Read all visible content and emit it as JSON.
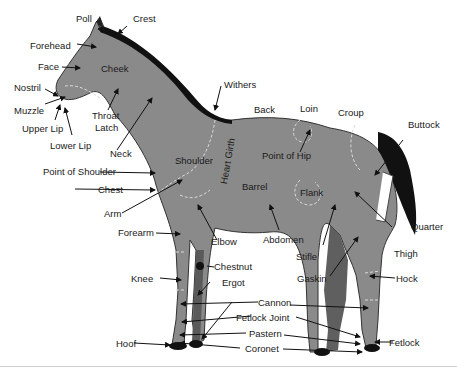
{
  "diagram": {
    "colors": {
      "body": "#8a8a8a",
      "mane_tail": "#111111",
      "shade_leg": "#5a5a5a",
      "seam": "#d8d8d8",
      "text": "#1a1a1a"
    },
    "labels": {
      "poll": "Poll",
      "crest": "Crest",
      "forehead": "Forehead",
      "face": "Face",
      "cheek": "Cheek",
      "nostril": "Nostril",
      "muzzle": "Muzzle",
      "upper_lip": "Upper Lip",
      "lower_lip": "Lower Lip",
      "throat_latch_1": "Throat",
      "throat_latch_2": "Latch",
      "neck": "Neck",
      "withers": "Withers",
      "back": "Back",
      "loin": "Loin",
      "croup": "Croup",
      "buttock": "Buttock",
      "point_of_hip": "Point of Hip",
      "shoulder": "Shoulder",
      "heart_girth": "Heart Girth",
      "barrel": "Barrel",
      "flank": "Flank",
      "point_of_shoulder": "Point of Shoulder",
      "chest": "Chest",
      "arm": "Arm",
      "forearm": "Forearm",
      "elbow": "Elbow",
      "abdomen": "Abdomen",
      "stifle": "Stifle",
      "thigh": "Thigh",
      "quarter": "Quarter",
      "gaskin": "Gaskin",
      "hock": "Hock",
      "knee": "Knee",
      "chestnut": "Chestnut",
      "ergot": "Ergot",
      "cannon": "Cannon",
      "fetlock_joint": "Fetlock Joint",
      "pastern": "Pastern",
      "coronet": "Coronet",
      "hoof": "Hoof",
      "fetlock": "Fetlock"
    }
  }
}
